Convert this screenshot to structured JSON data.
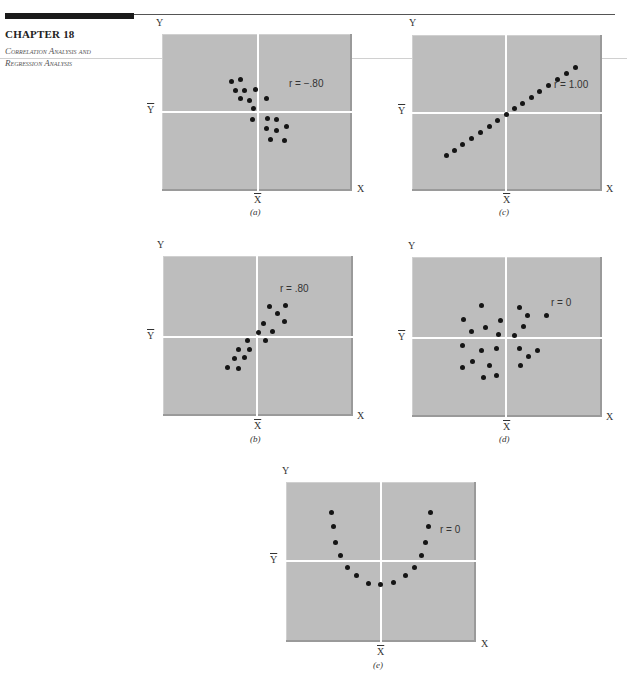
{
  "header": {
    "chapter": "CHAPTER 18",
    "subtitle_line1": "Correlation Analysis and",
    "subtitle_line2": "Regression Analysis"
  },
  "axis_labels": {
    "y": "Y",
    "x": "X",
    "ybar": "Y",
    "xbar": "X"
  },
  "colors": {
    "plot_bg": "#bdbdbd",
    "point": "#151515",
    "mean_lines": "#ffffff",
    "header_bar": "#1a1a1a"
  },
  "panels": {
    "a": {
      "caption": "(a)",
      "r_label": "r = −.80"
    },
    "b": {
      "caption": "(b)",
      "r_label": "r = .80"
    },
    "c": {
      "caption": "(c)",
      "r_label": "r = 1.00"
    },
    "d": {
      "caption": "(d)",
      "r_label": "r = 0"
    },
    "e": {
      "caption": "(e)",
      "r_label": "r = 0"
    }
  },
  "chart_data": [
    {
      "id": "a",
      "type": "scatter",
      "title": "(a)",
      "annotation": "r = -.80",
      "xlabel": "X",
      "ylabel": "Y",
      "mean_lines": {
        "x": "X̄",
        "y": "Ȳ"
      },
      "grid": false,
      "box": [
        162,
        34,
        190,
        157
      ],
      "mean_px": [
        96,
        78
      ],
      "points_px": [
        [
          69,
          47
        ],
        [
          78,
          45
        ],
        [
          73,
          56
        ],
        [
          82,
          56
        ],
        [
          93,
          55
        ],
        [
          78,
          64
        ],
        [
          87,
          66
        ],
        [
          104,
          64
        ],
        [
          91,
          74
        ],
        [
          90,
          85
        ],
        [
          105,
          84
        ],
        [
          114,
          85
        ],
        [
          124,
          92
        ],
        [
          104,
          94
        ],
        [
          114,
          96
        ],
        [
          108,
          105
        ],
        [
          122,
          106
        ]
      ]
    },
    {
      "id": "b",
      "type": "scatter",
      "title": "(b)",
      "annotation": "r = .80",
      "xlabel": "X",
      "ylabel": "Y",
      "mean_lines": {
        "x": "X̄",
        "y": "Ȳ"
      },
      "grid": false,
      "box": [
        163,
        256,
        190,
        160
      ],
      "mean_px": [
        94,
        81
      ],
      "points_px": [
        [
          106,
          50
        ],
        [
          122,
          49
        ],
        [
          114,
          57
        ],
        [
          121,
          65
        ],
        [
          100,
          67
        ],
        [
          109,
          75
        ],
        [
          95,
          76
        ],
        [
          84,
          84
        ],
        [
          102,
          84
        ],
        [
          75,
          93
        ],
        [
          86,
          93
        ],
        [
          71,
          102
        ],
        [
          81,
          101
        ],
        [
          64,
          111
        ],
        [
          75,
          112
        ]
      ]
    },
    {
      "id": "c",
      "type": "scatter",
      "title": "(c)",
      "annotation": "r = 1.00",
      "xlabel": "X",
      "ylabel": "Y",
      "mean_lines": {
        "x": "X̄",
        "y": "Ȳ"
      },
      "grid": false,
      "box": [
        412,
        35,
        190,
        156
      ],
      "mean_px": [
        94,
        78
      ],
      "points_px": [
        [
          34,
          120
        ],
        [
          42,
          115
        ],
        [
          50,
          109
        ],
        [
          59,
          103
        ],
        [
          68,
          97
        ],
        [
          77,
          91
        ],
        [
          85,
          85
        ],
        [
          94,
          79
        ],
        [
          102,
          73
        ],
        [
          110,
          68
        ],
        [
          119,
          62
        ],
        [
          127,
          56
        ],
        [
          136,
          50
        ],
        [
          145,
          44
        ],
        [
          154,
          38
        ],
        [
          163,
          32
        ]
      ]
    },
    {
      "id": "d",
      "type": "scatter",
      "title": "(d)",
      "annotation": "r = 0",
      "xlabel": "X",
      "ylabel": "Y",
      "mean_lines": {
        "x": "X̄",
        "y": "Ȳ"
      },
      "grid": false,
      "box": [
        412,
        257,
        190,
        160
      ],
      "mean_px": [
        94,
        81
      ],
      "points_px": [
        [
          69,
          48
        ],
        [
          107,
          50
        ],
        [
          51,
          62
        ],
        [
          88,
          63
        ],
        [
          115,
          58
        ],
        [
          134,
          58
        ],
        [
          59,
          74
        ],
        [
          73,
          70
        ],
        [
          111,
          69
        ],
        [
          86,
          77
        ],
        [
          102,
          78
        ],
        [
          50,
          88
        ],
        [
          69,
          93
        ],
        [
          84,
          91
        ],
        [
          107,
          91
        ],
        [
          125,
          93
        ],
        [
          116,
          99
        ],
        [
          60,
          104
        ],
        [
          50,
          110
        ],
        [
          77,
          108
        ],
        [
          108,
          108
        ],
        [
          71,
          120
        ],
        [
          84,
          118
        ]
      ]
    },
    {
      "id": "e",
      "type": "scatter",
      "title": "(e)",
      "annotation": "r = 0",
      "xlabel": "X",
      "ylabel": "Y",
      "mean_lines": {
        "x": "X̄",
        "y": "Ȳ"
      },
      "grid": false,
      "box": [
        286,
        482,
        190,
        160
      ],
      "mean_px": [
        95,
        79
      ],
      "points_px": [
        [
          45,
          30
        ],
        [
          47,
          44
        ],
        [
          49,
          60
        ],
        [
          54,
          73
        ],
        [
          61,
          85
        ],
        [
          70,
          93
        ],
        [
          82,
          101
        ],
        [
          94,
          102
        ],
        [
          107,
          100
        ],
        [
          119,
          93
        ],
        [
          128,
          85
        ],
        [
          135,
          73
        ],
        [
          139,
          60
        ],
        [
          142,
          44
        ],
        [
          144,
          30
        ]
      ]
    }
  ]
}
